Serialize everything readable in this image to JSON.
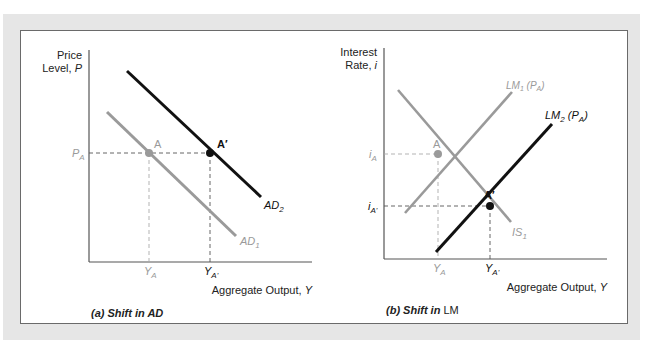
{
  "colors": {
    "frame": "#e6e6e6",
    "shifted_curve": "#111111",
    "original_curve": "#9a9a9a",
    "axis": "#555555",
    "label": "#222222",
    "gray_label": "#9a9a9a"
  },
  "panel_a": {
    "caption_prefix": "(a) Shift in AD",
    "y_axis_label_line1": "Price",
    "y_axis_label_line2_prefix": "Level, ",
    "y_axis_label_var": "P",
    "x_axis_label_prefix": "Aggregate Output, ",
    "x_axis_label_var": "Y",
    "y_tick": {
      "base": "P",
      "sub": "A"
    },
    "x_ticks": [
      {
        "base": "Y",
        "sub": "A"
      },
      {
        "base": "Y",
        "sub": "A'"
      }
    ],
    "points": [
      {
        "label": "A"
      },
      {
        "label": "A′"
      }
    ],
    "curves": [
      {
        "name": "AD",
        "sub": "1",
        "style": "gray"
      },
      {
        "name": "AD",
        "sub": "2",
        "style": "black"
      }
    ]
  },
  "panel_b": {
    "caption_prefix": "(b) Shift in ",
    "caption_suffix": "LM",
    "y_axis_label_line1": "Interest",
    "y_axis_label_line2_prefix": "Rate, ",
    "y_axis_label_var": "i",
    "x_axis_label_prefix": "Aggregate Output, ",
    "x_axis_label_var": "Y",
    "y_ticks": [
      {
        "base": "i",
        "sub": "A"
      },
      {
        "base": "i",
        "sub": "A'"
      }
    ],
    "x_ticks": [
      {
        "base": "Y",
        "sub": "A"
      },
      {
        "base": "Y",
        "sub": "A'"
      }
    ],
    "points": [
      {
        "label": "A"
      },
      {
        "label": "A′"
      }
    ],
    "curves": [
      {
        "name": "IS",
        "sub": "1",
        "style": "gray"
      },
      {
        "name": "LM",
        "sub": "1",
        "suffix": "(P",
        "suffix_sub": "A",
        "suffix_end": ")",
        "style": "gray"
      },
      {
        "name": "LM",
        "sub": "2",
        "suffix": "(P",
        "suffix_sub": "A",
        "suffix_end": ")",
        "style": "black"
      }
    ]
  }
}
